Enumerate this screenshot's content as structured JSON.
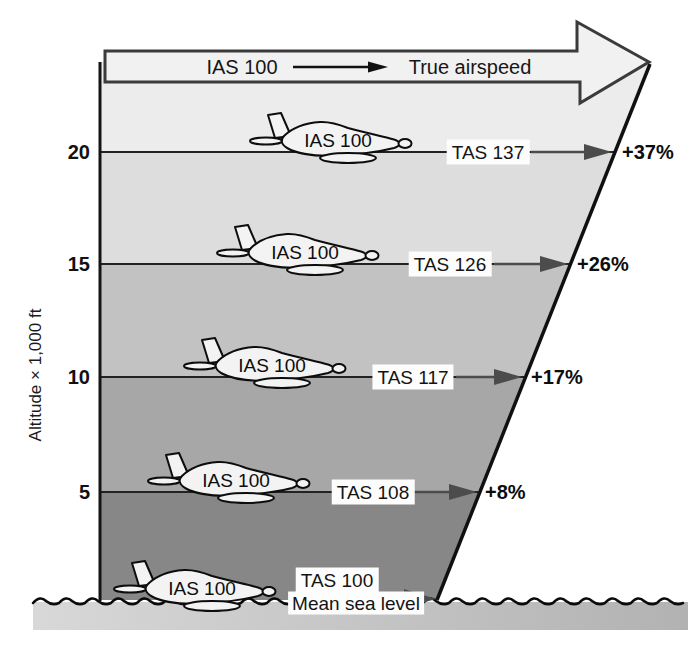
{
  "banner": {
    "ias_label": "IAS 100",
    "true_airspeed_label": "True airspeed"
  },
  "y_axis": {
    "label": "Altitude × 1,000 ft"
  },
  "levels": [
    {
      "tick": "20",
      "plane_ias": "IAS 100",
      "tas_label": "TAS 137",
      "pct_label": "+37%"
    },
    {
      "tick": "15",
      "plane_ias": "IAS 100",
      "tas_label": "TAS 126",
      "pct_label": "+26%"
    },
    {
      "tick": "10",
      "plane_ias": "IAS 100",
      "tas_label": "TAS 117",
      "pct_label": "+17%"
    },
    {
      "tick": "5",
      "plane_ias": "IAS 100",
      "tas_label": "TAS 108",
      "pct_label": "+8%"
    },
    {
      "tick": "0",
      "plane_ias": "IAS 100",
      "tas_label": "TAS 100",
      "pct_label": ""
    }
  ],
  "sea": {
    "mean_sea_level_label": "Mean sea level"
  },
  "colors": {
    "band1": "#ececec",
    "band2": "#dddddd",
    "band3": "#c2c2c2",
    "band4": "#a7a7a7",
    "band5": "#878787",
    "banner_fill": "#f1f1f1",
    "banner_stroke": "#3b3b3b",
    "edge_line": "#101010",
    "arrow": "#4c4c4c",
    "plane_fill": "#f3f3f3",
    "water_strip_left": "#d8d8d8",
    "water_strip_right": "#b2b2b2"
  },
  "chart_data": {
    "type": "table",
    "xlabel": "Airspeed (kt)",
    "ylabel": "Altitude × 1,000 ft",
    "categories_altitude_kft": [
      20,
      15,
      10,
      5,
      0
    ],
    "series": [
      {
        "name": "IAS",
        "values": [
          100,
          100,
          100,
          100,
          100
        ]
      },
      {
        "name": "TAS",
        "values": [
          137,
          126,
          117,
          108,
          100
        ]
      },
      {
        "name": "TAS increase %",
        "values": [
          37,
          26,
          17,
          8,
          0
        ]
      }
    ],
    "annotations": [
      "IAS 100 → True airspeed",
      "Mean sea level"
    ]
  }
}
